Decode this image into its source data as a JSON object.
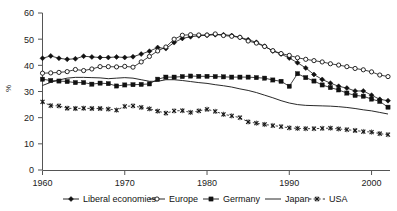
{
  "chart_data": {
    "type": "line",
    "title": "",
    "xlabel": "",
    "ylabel": "%",
    "xlim": [
      1960,
      2002
    ],
    "ylim": [
      0,
      60
    ],
    "yticks": [
      0,
      10,
      20,
      30,
      40,
      50,
      60
    ],
    "xticks": [
      1960,
      1970,
      1980,
      1990,
      2000
    ],
    "grid": false,
    "legend_position": "bottom",
    "x": [
      1960,
      1961,
      1962,
      1963,
      1964,
      1965,
      1966,
      1967,
      1968,
      1969,
      1970,
      1971,
      1972,
      1973,
      1974,
      1975,
      1976,
      1977,
      1978,
      1979,
      1980,
      1981,
      1982,
      1983,
      1984,
      1985,
      1986,
      1987,
      1988,
      1989,
      1990,
      1991,
      1992,
      1993,
      1994,
      1995,
      1996,
      1997,
      1998,
      1999,
      2000,
      2001,
      2002
    ],
    "series": [
      {
        "name": "Liberal economies",
        "marker": "filled-diamond",
        "style": "solid",
        "values": [
          42.7,
          43.6,
          42.7,
          42.3,
          42.5,
          43.5,
          43.2,
          43.0,
          43.0,
          43.2,
          43.0,
          43.3,
          44.3,
          45.4,
          46.8,
          46.4,
          48.7,
          50.3,
          50.9,
          51.3,
          51.5,
          51.7,
          51.7,
          51.4,
          50.7,
          49.8,
          48.8,
          47.3,
          45.5,
          44.3,
          42.8,
          41.0,
          39.0,
          36.5,
          34.6,
          33.2,
          32.0,
          31.3,
          30.2,
          30.2,
          28.6,
          27.0,
          26.5
        ]
      },
      {
        "name": "Europe",
        "marker": "open-circle",
        "style": "solid",
        "values": [
          37.0,
          37.1,
          37.3,
          37.6,
          38.4,
          38.0,
          38.6,
          39.5,
          39.5,
          39.4,
          39.6,
          39.3,
          41.3,
          43.4,
          45.5,
          47.0,
          50.0,
          51.5,
          51.7,
          51.6,
          51.6,
          52.0,
          51.4,
          51.1,
          50.7,
          49.3,
          48.5,
          47.2,
          45.6,
          44.5,
          43.8,
          42.9,
          42.3,
          41.8,
          41.3,
          40.6,
          40.1,
          39.5,
          38.8,
          38.3,
          37.5,
          36.3,
          35.7
        ]
      },
      {
        "name": "Germany",
        "marker": "filled-square",
        "style": "solid",
        "values": [
          34.7,
          34.2,
          34.0,
          33.8,
          33.4,
          33.4,
          32.8,
          33.2,
          33.0,
          32.1,
          32.5,
          32.6,
          32.7,
          32.9,
          34.7,
          35.5,
          35.5,
          35.7,
          35.9,
          35.8,
          35.8,
          35.7,
          35.6,
          35.5,
          35.5,
          35.5,
          35.3,
          35.1,
          34.4,
          33.9,
          32.0,
          36.8,
          35.3,
          34.0,
          32.5,
          31.5,
          30.6,
          29.4,
          28.5,
          28.2,
          27.1,
          26.2,
          24.0
        ]
      },
      {
        "name": "Japan",
        "marker": "none",
        "style": "solid",
        "values": [
          32.3,
          33.5,
          34.4,
          35.1,
          35.4,
          35.4,
          35.3,
          35.2,
          34.9,
          35.1,
          35.3,
          35.1,
          34.5,
          33.9,
          33.9,
          34.5,
          34.5,
          34.2,
          33.8,
          33.4,
          33.1,
          32.6,
          32.2,
          31.7,
          31.0,
          30.4,
          29.6,
          28.6,
          27.6,
          26.5,
          25.6,
          25.0,
          24.7,
          24.6,
          24.5,
          24.4,
          24.2,
          23.9,
          23.5,
          23.0,
          22.6,
          22.0,
          21.4
        ]
      },
      {
        "name": "USA",
        "marker": "cross-x",
        "style": "dashed",
        "values": [
          26.0,
          24.6,
          24.5,
          23.6,
          23.5,
          23.6,
          23.5,
          23.5,
          23.3,
          22.9,
          24.3,
          24.5,
          23.9,
          23.4,
          22.5,
          21.7,
          22.6,
          22.7,
          22.0,
          22.6,
          23.2,
          22.4,
          21.3,
          20.7,
          20.0,
          18.4,
          17.9,
          17.4,
          17.0,
          16.6,
          16.1,
          15.9,
          15.8,
          15.8,
          15.9,
          16.0,
          15.7,
          15.4,
          15.1,
          14.7,
          14.5,
          13.9,
          13.5
        ]
      }
    ]
  },
  "legend": {
    "entries": [
      {
        "label": "Liberal economies",
        "marker": "filled-diamond"
      },
      {
        "label": "Europe",
        "marker": "open-circle"
      },
      {
        "label": "Germany",
        "marker": "filled-square"
      },
      {
        "label": "Japan",
        "marker": "none"
      },
      {
        "label": "USA",
        "marker": "cross-x"
      }
    ]
  },
  "axes": {
    "y_tick_labels": [
      "0",
      "10",
      "20",
      "30",
      "40",
      "50",
      "60"
    ],
    "x_tick_labels": [
      "1960",
      "1970",
      "1980",
      "1990",
      "2000"
    ],
    "y_axis_title": "%"
  },
  "colors": {
    "ink": "#111111",
    "axis": "#555555",
    "background": "#ffffff"
  }
}
